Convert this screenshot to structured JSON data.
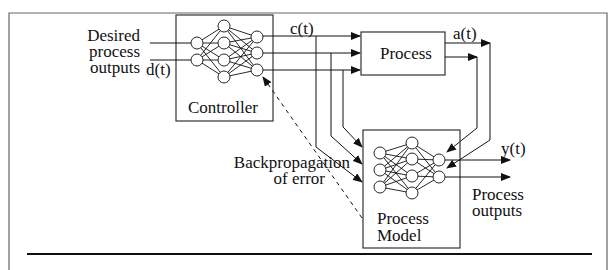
{
  "diagram": {
    "type": "neural network control system block diagram",
    "blocks": {
      "controller": {
        "label": "Controller"
      },
      "process": {
        "label": "Process"
      },
      "process_model": {
        "label_line1": "Process",
        "label_line2": "Model"
      }
    },
    "signals": {
      "desired_line1": "Desired",
      "desired_line2": "process",
      "desired_line3": "outputs",
      "d": "d(t)",
      "c": "c(t)",
      "a": "a(t)",
      "y": "y(t)",
      "process_outputs_line1": "Process",
      "process_outputs_line2": "outputs",
      "backprop_line1": "Backpropagation",
      "backprop_line2": "of error"
    },
    "colors": {
      "line": "#111111",
      "frame": "#555555",
      "background": "#ffffff"
    }
  }
}
